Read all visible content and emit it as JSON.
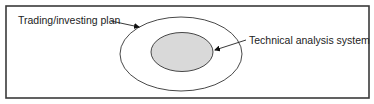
{
  "diagram": {
    "type": "nested-ellipse",
    "frame": {
      "x": 6,
      "y": 6,
      "w": 363,
      "h": 92,
      "stroke": "#3a3a3a"
    },
    "outer": {
      "label": "Trading/investing plan",
      "cx": 181,
      "cy": 54,
      "rx": 61,
      "ry": 37,
      "fill": "#ffffff",
      "stroke": "#333333"
    },
    "inner": {
      "label": "Technical analysis system",
      "cx": 182,
      "cy": 52,
      "rx": 31,
      "ry": 19.5,
      "fill": "#d9d9d9",
      "stroke": "#333333"
    }
  }
}
